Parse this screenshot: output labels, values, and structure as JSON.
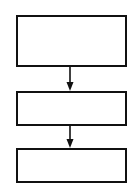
{
  "diagram": {
    "type": "flowchart",
    "orientation": "vertical",
    "colors": {
      "stroke": "#111111",
      "fill": "#ffffff",
      "background": "#ffffff"
    },
    "nodes": [
      {
        "id": "box-1",
        "label": "",
        "x": 16,
        "y": 15,
        "w": 111,
        "h": 52
      },
      {
        "id": "box-2",
        "label": "",
        "x": 16,
        "y": 91,
        "w": 111,
        "h": 35
      },
      {
        "id": "box-3",
        "label": "",
        "x": 16,
        "y": 148,
        "w": 111,
        "h": 35
      }
    ],
    "edges": [
      {
        "from": "box-1",
        "to": "box-2",
        "x": 70,
        "y1": 67,
        "y2": 91
      },
      {
        "from": "box-2",
        "to": "box-3",
        "x": 70,
        "y1": 126,
        "y2": 148
      }
    ]
  }
}
